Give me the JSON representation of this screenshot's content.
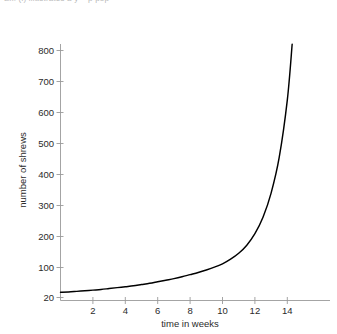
{
  "top_caption": {
    "text": "Ex. (i) illustrates a y = p pop",
    "note_visible": "clipped-illegible-fragment"
  },
  "chart_data": {
    "type": "line",
    "title": "",
    "subtitle": "",
    "xlabel": "time in weeks",
    "ylabel": "number of shrews",
    "xlim": [
      0,
      15.2
    ],
    "ylim": [
      20,
      860
    ],
    "grid": false,
    "legend": null,
    "legend_position": "none",
    "xticks": [
      2,
      4,
      6,
      8,
      10,
      12,
      14
    ],
    "xtick_labels": [
      "2",
      "4",
      "6",
      "8",
      "10",
      "12",
      "14"
    ],
    "yticks": [
      20,
      100,
      200,
      300,
      400,
      500,
      600,
      700,
      800
    ],
    "ytick_labels": [
      "20",
      "100",
      "200",
      "300",
      "400",
      "500",
      "600",
      "700",
      "800"
    ],
    "series": [
      {
        "name": "shrew population",
        "color": "#000000",
        "x": [
          0,
          0.5,
          1,
          1.5,
          2,
          2.5,
          3,
          3.5,
          4,
          4.5,
          5,
          5.5,
          6,
          6.5,
          7,
          7.5,
          8,
          8.5,
          9,
          9.5,
          10,
          10.5,
          11,
          11.5,
          12,
          12.5,
          13,
          13.5,
          14,
          14.3
        ],
        "values": [
          20,
          21,
          23,
          25,
          27,
          29,
          32,
          35,
          38,
          41,
          45,
          49,
          54,
          59,
          64,
          70,
          77,
          84,
          92,
          101,
          112,
          127,
          146,
          172,
          209,
          262,
          340,
          455,
          640,
          820
        ]
      }
    ],
    "annotations": []
  },
  "axes": {
    "x_axis_name": "time-axis",
    "y_axis_name": "population-axis"
  }
}
